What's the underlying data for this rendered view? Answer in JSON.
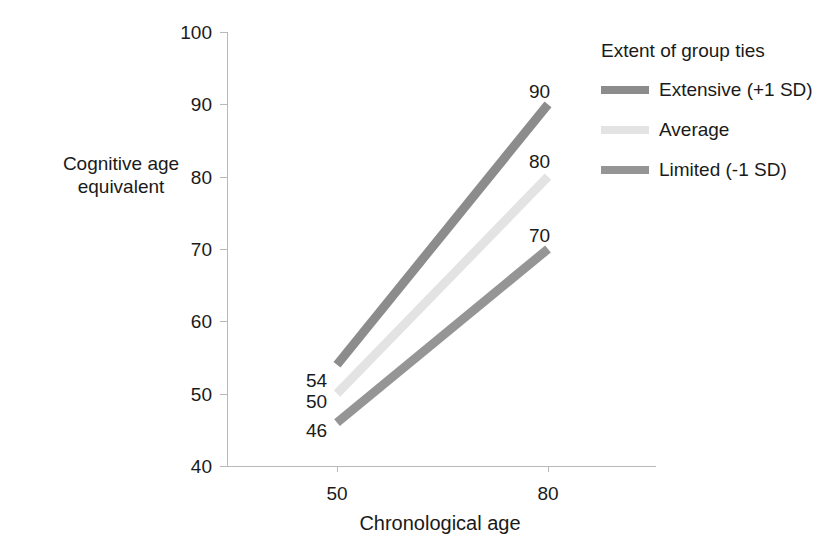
{
  "chart_data": {
    "type": "line",
    "title": "",
    "xlabel": "Chronological age",
    "ylabel": "Cognitive age equivalent",
    "categories": [
      "50",
      "80"
    ],
    "x": [
      50,
      80
    ],
    "xlim": [
      50,
      80
    ],
    "ylim": [
      40,
      100
    ],
    "yticks": [
      "100",
      "90",
      "80",
      "70",
      "60",
      "50",
      "40"
    ],
    "ytick_values": [
      100,
      90,
      80,
      70,
      60,
      50,
      40
    ],
    "grid": false,
    "legend_position": "top-right",
    "legend_title": "Extent of group ties",
    "series": [
      {
        "name": "Extensive (+1 SD)",
        "values": [
          54,
          90
        ],
        "labels": [
          "54",
          "90"
        ],
        "color": "#8c8c8c"
      },
      {
        "name": "Average",
        "values": [
          50,
          80
        ],
        "labels": [
          "50",
          "80"
        ],
        "color": "#e3e3e3"
      },
      {
        "name": "Limited (-1 SD)",
        "values": [
          46,
          70
        ],
        "labels": [
          "46",
          "70"
        ],
        "color": "#959595"
      }
    ]
  },
  "axes": {
    "y_title_line1": "Cognitive age",
    "y_title_line2": "equivalent",
    "x_title": "Chronological age",
    "y_tick_100": "100",
    "y_tick_90": "90",
    "y_tick_80": "80",
    "y_tick_70": "70",
    "y_tick_60": "60",
    "y_tick_50": "50",
    "y_tick_40": "40",
    "x_tick_1": "50",
    "x_tick_2": "80"
  },
  "legend": {
    "title": "Extent of group ties",
    "items": [
      {
        "label": "Extensive (+1 SD)",
        "color": "#8c8c8c"
      },
      {
        "label": "Average",
        "color": "#e3e3e3"
      },
      {
        "label": "Limited (-1 SD)",
        "color": "#959595"
      }
    ]
  },
  "data_labels": {
    "extensive_left": "54",
    "extensive_right": "90",
    "average_left": "50",
    "average_right": "80",
    "limited_left": "46",
    "limited_right": "70"
  }
}
